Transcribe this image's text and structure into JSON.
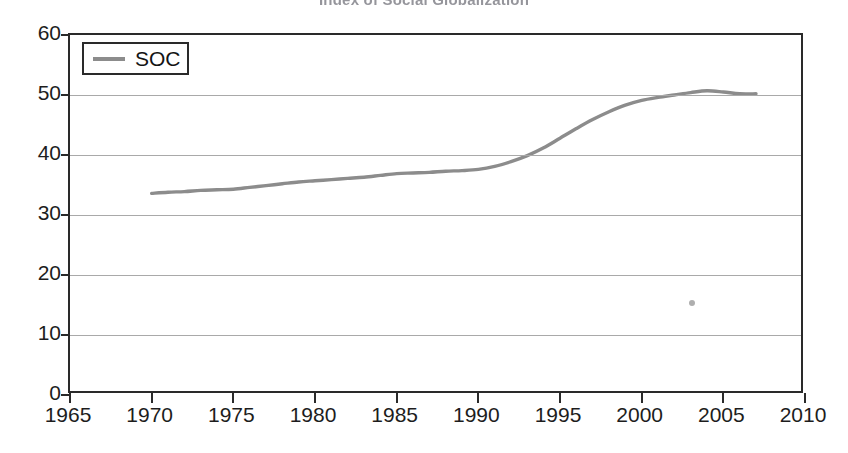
{
  "title": "Index of Social Globalization",
  "legend": {
    "entries": [
      {
        "label": "SOC",
        "color": "#8c8c8c"
      }
    ]
  },
  "axes": {
    "x": {
      "ticks": [
        1965,
        1970,
        1975,
        1980,
        1985,
        1990,
        1995,
        2000,
        2005,
        2010
      ],
      "labels": [
        "1965",
        "1970",
        "1975",
        "1980",
        "1985",
        "1990",
        "1995",
        "2000",
        "2005",
        "2010"
      ],
      "min": 1965,
      "max": 2010
    },
    "y": {
      "ticks": [
        0,
        10,
        20,
        30,
        40,
        50,
        60
      ],
      "labels": [
        "0",
        "10",
        "20",
        "30",
        "40",
        "50",
        "60"
      ],
      "min": 0,
      "max": 60
    }
  },
  "chart_data": {
    "type": "line",
    "title": "Index of Social Globalization",
    "xlabel": "",
    "ylabel": "",
    "xlim": [
      1965,
      2010
    ],
    "ylim": [
      0,
      60
    ],
    "grid": "horizontal",
    "legend_position": "top-left",
    "series": [
      {
        "name": "SOC",
        "color": "#8c8c8c",
        "x": [
          1970,
          1971,
          1972,
          1973,
          1974,
          1975,
          1976,
          1977,
          1978,
          1979,
          1980,
          1981,
          1982,
          1983,
          1984,
          1985,
          1986,
          1987,
          1988,
          1989,
          1990,
          1991,
          1992,
          1993,
          1994,
          1995,
          1996,
          1997,
          1998,
          1999,
          2000,
          2001,
          2002,
          2003,
          2004,
          2005,
          2006,
          2007
        ],
        "values": [
          33.6,
          33.8,
          33.9,
          34.1,
          34.2,
          34.3,
          34.6,
          34.9,
          35.2,
          35.5,
          35.7,
          35.9,
          36.1,
          36.3,
          36.6,
          36.9,
          37.0,
          37.1,
          37.3,
          37.4,
          37.6,
          38.1,
          38.9,
          39.9,
          41.2,
          42.8,
          44.4,
          45.9,
          47.2,
          48.3,
          49.1,
          49.6,
          50.0,
          50.4,
          50.7,
          50.5,
          50.2,
          50.2
        ]
      }
    ]
  }
}
